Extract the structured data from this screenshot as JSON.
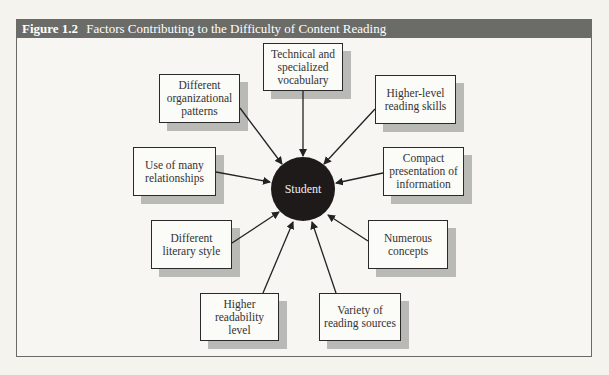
{
  "figure": {
    "number": "Figure 1.2",
    "title": "Factors Contributing to the Difficulty of Content Reading"
  },
  "diagram": {
    "center": {
      "label": "Student"
    },
    "nodes": [
      {
        "id": "technical",
        "label": "Technical and specialized vocabulary"
      },
      {
        "id": "higher_level",
        "label": "Higher-level reading skills"
      },
      {
        "id": "compact",
        "label": "Compact presentation of information"
      },
      {
        "id": "numerous",
        "label": "Numerous concepts"
      },
      {
        "id": "variety",
        "label": "Variety of reading sources"
      },
      {
        "id": "readability",
        "label": "Higher readability level"
      },
      {
        "id": "literary",
        "label": "Different literary style"
      },
      {
        "id": "relationships",
        "label": "Use of many relationships"
      },
      {
        "id": "organizational",
        "label": "Different organizational patterns"
      }
    ],
    "edges_direction": "node-to-center"
  },
  "colors": {
    "title_bar": "#6b6b68",
    "hub": "#1f1a1a",
    "shadow": "#b9b9b6",
    "background": "#f7f6f2"
  }
}
